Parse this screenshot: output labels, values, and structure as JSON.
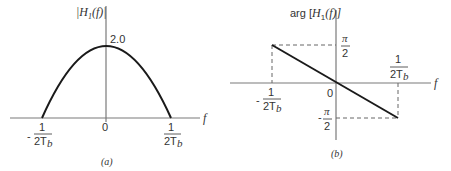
{
  "panel_a": {
    "caption": "(a)",
    "y_label": "|H",
    "y_label_sub": "1",
    "y_label_tail": "(f)|",
    "x_label": "f",
    "peak_label": "2.0",
    "origin_label": "0",
    "left_tick": {
      "sign": "-",
      "num": "1",
      "den": "2T",
      "den_sub": "b"
    },
    "right_tick": {
      "num": "1",
      "den": "2T",
      "den_sub": "b"
    }
  },
  "panel_b": {
    "caption": "(b)",
    "y_label_prefix": "arg [",
    "y_label": "H",
    "y_label_sub": "1",
    "y_label_tail": "(f)]",
    "x_label": "f",
    "origin_label": "0",
    "top_tick": {
      "num": "π",
      "den": "2"
    },
    "bottom_tick": {
      "sign": "-",
      "num": "π",
      "den": "2"
    },
    "left_tick": {
      "sign": "-",
      "num": "1",
      "den": "2T",
      "den_sub": "b"
    },
    "right_tick": {
      "num": "1",
      "den": "2T",
      "den_sub": "b"
    }
  },
  "colors": {
    "axis": "#7a7a7a",
    "curve": "#1a1a1a",
    "dashed": "#666666",
    "text": "#333333"
  }
}
